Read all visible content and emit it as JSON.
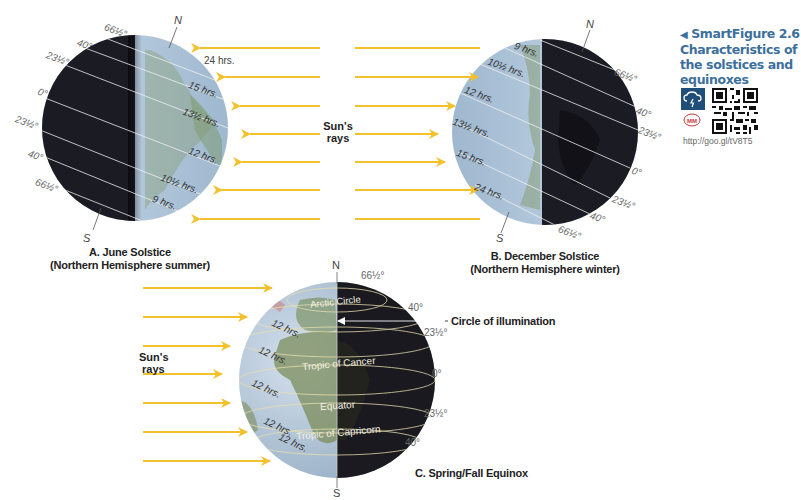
{
  "figure": {
    "smartfigure_label": "SmartFigure 2.6",
    "title_line1": "Characteristics of",
    "title_line2": "the solstices and",
    "title_line3": "equinoxes",
    "url": "http://goo.gl/tV8T5",
    "icons": [
      "cloud-lightning-icon",
      "mastering-meteorology-icon",
      "qr-code"
    ],
    "colors": {
      "ray": "#f2c12e",
      "title_blue": "#3d6f9c",
      "icon_box": "#1f4e79",
      "dark_side": "#1c1c24",
      "light_side": "#b9cde0"
    }
  },
  "panels": {
    "june": {
      "caption_line1": "A. June Solstice",
      "caption_line2": "(Northern Hemisphere summer)",
      "north": "N",
      "south": "S",
      "latitudes": [
        "66½°",
        "40°",
        "23½°",
        "0°",
        "23½°",
        "40°",
        "66½°"
      ],
      "day_lengths": [
        "24 hrs.",
        "15 hrs.",
        "13½ hrs.",
        "12 hrs.",
        "10½ hrs.",
        "9 hrs."
      ],
      "rays_label_line1": "Sun's",
      "rays_label_line2": "rays"
    },
    "december": {
      "caption_line1": "B. December Solstice",
      "caption_line2": "(Northern Hemisphere winter)",
      "north": "N",
      "south": "S",
      "latitudes": [
        "66½°",
        "40°",
        "23½°",
        "0°",
        "23½°",
        "40°",
        "66½°"
      ],
      "day_lengths": [
        "9 hrs.",
        "10½ hrs.",
        "12 hrs.",
        "13½ hrs.",
        "15 hrs.",
        "24 hrs."
      ]
    },
    "equinox": {
      "caption": "C. Spring/Fall Equinox",
      "north": "N",
      "south": "S",
      "latitudes": [
        "66½°",
        "40°",
        "23½°",
        "0°",
        "23½°",
        "40°"
      ],
      "day_lengths": [
        "12 hrs.",
        "12 hrs.",
        "12 hrs.",
        "12 hrs.",
        "12 hrs."
      ],
      "circle_names": [
        "Arctic Circle",
        "Tropic of Cancer",
        "Equator",
        "Tropic of Capricorn"
      ],
      "circle_of_illumination": "Circle of illumination",
      "rays_label_line1": "Sun's",
      "rays_label_line2": "rays"
    }
  }
}
